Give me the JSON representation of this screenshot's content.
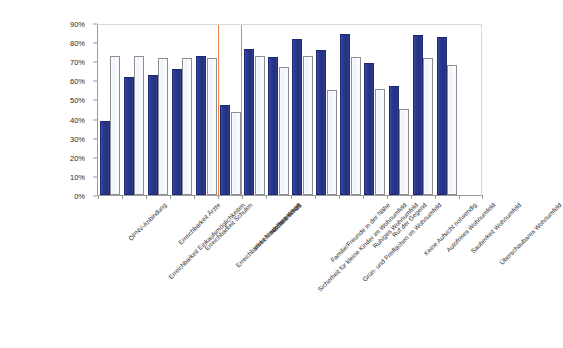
{
  "chart_data": {
    "type": "bar",
    "title": "",
    "subtitle": "",
    "xlabel": "",
    "ylabel": "",
    "ylim": [
      0,
      90
    ],
    "ytick_labels": [
      "90%",
      "80%",
      "70%",
      "60%",
      "50%",
      "40%",
      "30%",
      "20%",
      "10%",
      "0%"
    ],
    "ytick_values": [
      90,
      80,
      70,
      60,
      50,
      40,
      30,
      20,
      10,
      0
    ],
    "grid": false,
    "legend": "none",
    "categories": [
      "ÖPNV-Anbindung",
      "Erreichbarkeit Einkaufsmöglichkeiten",
      "Erreichbarkeit Ärzte",
      "Erreichbarkeit Schulen",
      "Erreichbarkeit Kinderbetreuung",
      "Verkehrssichere Wege",
      "Nachbarschaft",
      "Sicherheit für kleine Kinder im Wohnumfeld",
      "Familie/Freunde in der Nähe",
      "Grün- und Freiflächen im Wohnumfeld",
      "Ruhiges Wohnumfeld",
      "Ruf der Gegend",
      "Keine Aufsicht notwendig",
      "Autofreies Wohnumfeld",
      "Sauberkeit Wohnumfeld",
      "Überschaubares Wohnumfeld"
    ],
    "series": [
      {
        "name": "series-1",
        "color": "#2f3d96",
        "values": [
          38.5,
          62.0,
          63.0,
          66.0,
          72.5,
          47.0,
          76.5,
          72.0,
          81.5,
          76.0,
          84.0,
          69.0,
          57.0,
          83.5,
          82.5,
          0
        ]
      },
      {
        "name": "series-2",
        "color": "#f2f5fb",
        "values": [
          72.5,
          72.5,
          71.5,
          71.5,
          71.5,
          43.5,
          72.5,
          67.0,
          72.5,
          55.0,
          72.0,
          55.5,
          45.0,
          71.5,
          68.0,
          0
        ]
      }
    ],
    "annotations": [
      {
        "name": "orange-marker-left",
        "type": "vertical-line",
        "color": "#ec7c35",
        "at_category_index": 5
      },
      {
        "name": "orange-marker-right",
        "type": "vertical-line",
        "color": "#ec7c35",
        "at_category_index": 5
      }
    ]
  }
}
